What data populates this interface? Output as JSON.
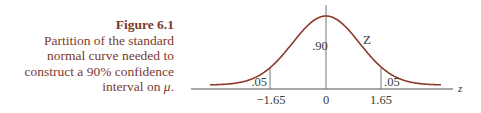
{
  "caption": {
    "figure_label": "Figure 6.1",
    "lines": [
      "Partition of the standard",
      "normal curve needed to",
      "construct a 90% confidence"
    ],
    "last_line_prefix": "interval on ",
    "last_line_symbol": "μ",
    "last_line_suffix": "."
  },
  "chart_data": {
    "type": "area",
    "title": "Partition of the standard normal curve needed to construct a 90% confidence interval on μ",
    "xlabel": "z",
    "ylabel": "",
    "curve_label": "Z",
    "x_ticks": [
      "−1.65",
      "0",
      "1.65"
    ],
    "x_tick_values": [
      -1.65,
      0,
      1.65
    ],
    "regions": [
      {
        "name": "left tail",
        "range": [
          null,
          -1.65
        ],
        "area": 0.05,
        "label": ".05"
      },
      {
        "name": "center",
        "range": [
          -1.65,
          1.65
        ],
        "area": 0.9,
        "label": ".90"
      },
      {
        "name": "right tail",
        "range": [
          1.65,
          null
        ],
        "area": 0.05,
        "label": ".05"
      }
    ],
    "distribution": "standard normal",
    "grid": false,
    "colors": {
      "curve": "#8b3a2a",
      "axis": "#555555"
    }
  },
  "labels": {
    "center_area": ".90",
    "left_tail": ".05",
    "right_tail": ".05",
    "curve_name": "Z",
    "axis_name": "z",
    "tick_left": "−1.65",
    "tick_center": "0",
    "tick_right": "1.65"
  }
}
